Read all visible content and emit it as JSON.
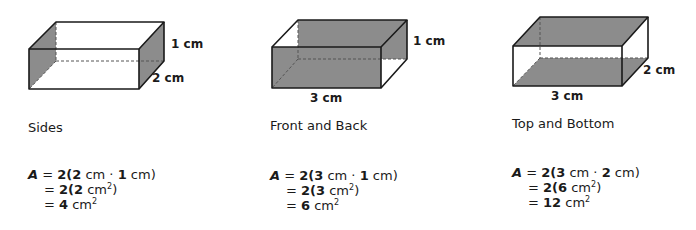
{
  "colors": {
    "shade": "#8c8c8c",
    "edge": "#1a1a1a",
    "dash": "#555555"
  },
  "figures": [
    {
      "id": "sides",
      "caption": "Sides",
      "labels": {
        "height": "1 cm",
        "depth": "2 cm"
      },
      "formula": {
        "line1": {
          "var": "A",
          "eq": "=",
          "k": "2(",
          "a": "2",
          "u1": " cm · ",
          "b": "1",
          "u2": " cm)"
        },
        "line2": {
          "eq": "=",
          "k": "2(",
          "a": "2",
          "u": " cm",
          "exp": "2",
          "close": ")"
        },
        "line3": {
          "eq": "=",
          "v": "4",
          "u": " cm",
          "exp": "2"
        }
      }
    },
    {
      "id": "front-and-back",
      "caption": "Front and Back",
      "labels": {
        "height": "1 cm",
        "width": "3 cm"
      },
      "formula": {
        "line1": {
          "var": "A",
          "eq": "=",
          "k": "2(",
          "a": "3",
          "u1": " cm · ",
          "b": "1",
          "u2": " cm)"
        },
        "line2": {
          "eq": "=",
          "k": "2(",
          "a": "3",
          "u": " cm",
          "exp": "2",
          "close": ")"
        },
        "line3": {
          "eq": "=",
          "v": "6",
          "u": " cm",
          "exp": "2"
        }
      }
    },
    {
      "id": "top-and-bottom",
      "caption": "Top and Bottom",
      "labels": {
        "depth": "2 cm",
        "width": "3 cm"
      },
      "formula": {
        "line1": {
          "var": "A",
          "eq": "=",
          "k": "2(",
          "a": "3",
          "u1": " cm · ",
          "b": "2",
          "u2": " cm)"
        },
        "line2": {
          "eq": "=",
          "k": "2(",
          "a": "6",
          "u": " cm",
          "exp": "2",
          "close": ")"
        },
        "line3": {
          "eq": "=",
          "v": "12",
          "u": " cm",
          "exp": "2"
        }
      }
    }
  ]
}
